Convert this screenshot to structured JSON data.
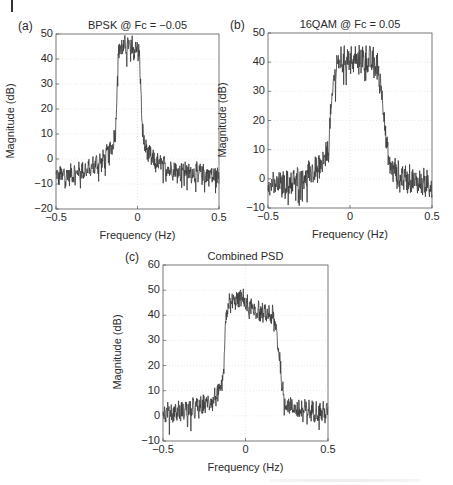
{
  "chart_data": [
    {
      "id": "a",
      "type": "line",
      "panel_label": "(a)",
      "title": "BPSK @ Fc = −0.05",
      "xlabel": "Frequency (Hz)",
      "ylabel": "Magnitude (dB)",
      "xlim": [
        -0.5,
        0.5
      ],
      "ylim": [
        -20,
        50
      ],
      "xticks": [
        -0.5,
        0,
        0.5
      ],
      "xtick_labels": [
        "−0.5",
        "0",
        "0.5"
      ],
      "yticks": [
        -20,
        -10,
        0,
        10,
        20,
        30,
        40,
        50
      ],
      "ytick_labels": [
        "−20",
        "−10",
        "0",
        "10",
        "20",
        "30",
        "40",
        "50"
      ],
      "grid": true,
      "series": [
        {
          "name": "BPSK PSD",
          "color": "#3a3a3a"
        }
      ],
      "envelope": {
        "x": [
          -0.5,
          -0.4,
          -0.3,
          -0.2,
          -0.15,
          -0.135,
          -0.125,
          -0.115,
          -0.1,
          -0.05,
          0.0,
          0.01,
          0.02,
          0.03,
          0.05,
          0.1,
          0.2,
          0.3,
          0.4,
          0.5
        ],
        "y": [
          -7,
          -6,
          -4,
          0,
          6,
          11,
          30,
          44,
          45,
          45,
          45,
          42,
          30,
          11,
          4,
          -1,
          -4,
          -5,
          -6,
          -7
        ],
        "noise_db": 3.5
      },
      "box": {
        "left": 56,
        "top": 34,
        "right": 219,
        "bottom": 209
      }
    },
    {
      "id": "b",
      "type": "line",
      "panel_label": "(b)",
      "title": "16QAM @ Fc = 0.05",
      "xlabel": "Frequency (Hz)",
      "ylabel": "Magnitude (dB)",
      "xlim": [
        -0.5,
        0.5
      ],
      "ylim": [
        -10,
        50
      ],
      "xticks": [
        -0.5,
        0,
        0.5
      ],
      "xtick_labels": [
        "−0.5",
        "0",
        "0.5"
      ],
      "yticks": [
        -10,
        0,
        10,
        20,
        30,
        40,
        50
      ],
      "ytick_labels": [
        "−10",
        "0",
        "10",
        "20",
        "30",
        "40",
        "50"
      ],
      "grid": true,
      "series": [
        {
          "name": "16QAM PSD",
          "color": "#3a3a3a"
        }
      ],
      "envelope": {
        "x": [
          -0.5,
          -0.4,
          -0.3,
          -0.2,
          -0.15,
          -0.13,
          -0.12,
          -0.1,
          -0.08,
          0.0,
          0.1,
          0.16,
          0.18,
          0.2,
          0.22,
          0.23,
          0.25,
          0.3,
          0.4,
          0.5
        ],
        "y": [
          -2,
          -2,
          0,
          3,
          7,
          11,
          20,
          33,
          40,
          41,
          41,
          40,
          36,
          27,
          14,
          8,
          4,
          1,
          -1,
          -2
        ],
        "noise_db": 4
      },
      "box": {
        "left": 268,
        "top": 33,
        "right": 432,
        "bottom": 208
      }
    },
    {
      "id": "c",
      "type": "line",
      "panel_label": "(c)",
      "title": "Combined PSD",
      "xlabel": "Frequency (Hz)",
      "ylabel": "Magnitude (dB)",
      "xlim": [
        -0.5,
        0.5
      ],
      "ylim": [
        -10,
        60
      ],
      "xticks": [
        -0.5,
        0,
        0.5
      ],
      "xtick_labels": [
        "−0.5",
        "0",
        "0.5"
      ],
      "yticks": [
        -10,
        0,
        10,
        20,
        30,
        40,
        50,
        60
      ],
      "ytick_labels": [
        "−10",
        "0",
        "10",
        "20",
        "30",
        "40",
        "50",
        "60"
      ],
      "grid": true,
      "series": [
        {
          "name": "Combined PSD",
          "color": "#3a3a3a"
        }
      ],
      "envelope": {
        "x": [
          -0.5,
          -0.4,
          -0.3,
          -0.2,
          -0.15,
          -0.135,
          -0.125,
          -0.11,
          -0.05,
          -0.02,
          0.02,
          0.1,
          0.16,
          0.18,
          0.2,
          0.22,
          0.23,
          0.25,
          0.3,
          0.4,
          0.5
        ],
        "y": [
          1,
          2,
          3,
          6,
          10,
          14,
          30,
          44,
          46,
          47,
          43,
          41,
          40,
          37,
          27,
          14,
          8,
          5,
          3,
          2,
          1
        ],
        "noise_db": 3.5
      },
      "box": {
        "left": 163,
        "top": 265,
        "right": 328,
        "bottom": 441
      }
    }
  ]
}
